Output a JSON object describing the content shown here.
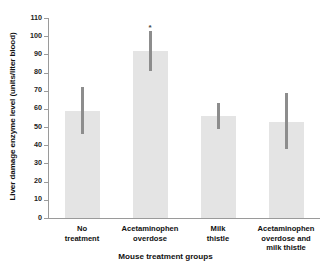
{
  "chart_data": {
    "type": "bar",
    "title": "",
    "xlabel": "Mouse treatment groups",
    "ylabel": "Liver damage enzyme level (units/liter blood)",
    "categories": [
      "No\ntreatment",
      "Acetaminophen\noverdose",
      "Milk\nthistle",
      "Acetaminophen\noverdose and\nmilk thistle"
    ],
    "values": [
      59,
      92,
      56,
      53
    ],
    "error_low": [
      46,
      81,
      49,
      38
    ],
    "error_high": [
      72,
      103,
      63,
      69
    ],
    "annotations": [
      {
        "category_index": 1,
        "text": "*",
        "value": 106
      }
    ],
    "ylim": [
      0,
      110
    ],
    "yticks": [
      0,
      10,
      20,
      30,
      40,
      50,
      60,
      70,
      80,
      90,
      100,
      110
    ],
    "ytick_labels": [
      "0",
      "10",
      "20",
      "30",
      "40",
      "50",
      "60",
      "70",
      "80",
      "90",
      "100",
      "110"
    ],
    "grid": false,
    "legend": false,
    "bar_color": "#e4e4e4",
    "error_color": "#8d8d8d",
    "axis_color": "#9a9a9a",
    "background": "#ffffff"
  }
}
